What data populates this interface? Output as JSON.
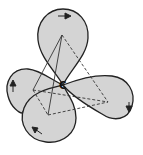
{
  "diagram": {
    "center_label": "C",
    "lobes": [
      {
        "name": "top",
        "arrow": "right"
      },
      {
        "name": "left",
        "arrow": "up"
      },
      {
        "name": "bottom",
        "arrow": "up-left"
      },
      {
        "name": "right",
        "arrow": "down"
      }
    ],
    "colors": {
      "lobe_fill": "#d4d4d4",
      "outline": "#222222",
      "background": "#ffffff"
    }
  }
}
